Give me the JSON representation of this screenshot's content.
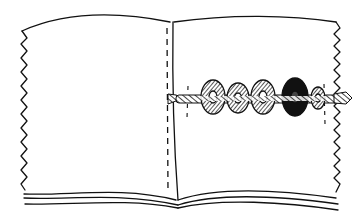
{
  "illustration": {
    "subject": "Open fabric book with a cord of beads threaded across the right page",
    "stroke_color": "#111111",
    "fill_color": "#ffffff",
    "bead_count": 5,
    "elements": [
      "left-page",
      "right-page",
      "spine",
      "stitch-line",
      "cord",
      "beads",
      "pinked-edges"
    ]
  }
}
